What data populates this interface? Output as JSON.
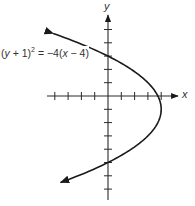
{
  "chart_data": {
    "type": "line",
    "title": "",
    "xlabel": "x",
    "ylabel": "y",
    "equation": "(y + 1)² = −4(x − 4)",
    "curve": "parabola opening left, vertex (4, -1), arrows on both ends",
    "vertex": [
      4,
      -1
    ],
    "y_intercepts": [
      3,
      -5
    ],
    "x_intercept": 3.75,
    "xlim": [
      -4.5,
      5.5
    ],
    "ylim": [
      -7.5,
      6.5
    ],
    "x_ticks": [
      -4,
      -3,
      -2,
      -1,
      1,
      2,
      3,
      4
    ],
    "y_ticks": [
      5,
      4,
      3,
      2,
      1,
      -1,
      -2,
      -3,
      -4,
      -5,
      -6,
      -7
    ],
    "tick_labels_shown": false,
    "grid": false,
    "legend": null,
    "points": [
      {
        "y": 4.7,
        "x": -4.12
      },
      {
        "y": 4,
        "x": -2.25
      },
      {
        "y": 3,
        "x": 0
      },
      {
        "y": 2,
        "x": 1.75
      },
      {
        "y": 1,
        "x": 3
      },
      {
        "y": 0,
        "x": 3.75
      },
      {
        "y": -1,
        "x": 4
      },
      {
        "y": -2,
        "x": 3.75
      },
      {
        "y": -3,
        "x": 3
      },
      {
        "y": -4,
        "x": 1.75
      },
      {
        "y": -5,
        "x": 0
      },
      {
        "y": -6,
        "x": -2.25
      },
      {
        "y": -6.5,
        "x": -3.56
      }
    ]
  },
  "labels": {
    "x_axis": "x",
    "y_axis": "y",
    "equation_parts": {
      "lhs_open": "(",
      "var_y": "y",
      "lhs_rest": " + 1)",
      "exp": "2",
      "rhs": " = −4(",
      "var_x": "x",
      "rhs_rest": " − 4)"
    }
  },
  "colors": {
    "curve": "#1a1a1a",
    "axis": "#2a2a2a",
    "text": "#333333"
  }
}
